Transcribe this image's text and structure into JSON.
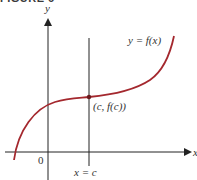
{
  "figure": {
    "title": "FIGURE 6",
    "curve_color": "#a4282e",
    "axis_color": "#222222"
  },
  "labels": {
    "y_axis": "y",
    "x_axis": "x",
    "origin": "0",
    "function": "y = f(x)",
    "point": "(c, f(c))",
    "vertical_line": "x = c"
  }
}
